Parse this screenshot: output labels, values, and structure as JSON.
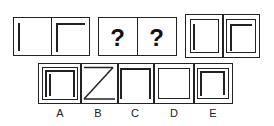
{
  "puzzle": {
    "given_panels": [
      {
        "id": "panel-1",
        "description": "single vertical line"
      },
      {
        "id": "panel-2",
        "description": "vertical line with top horizontal line"
      }
    ],
    "unknown_panels": [
      {
        "id": "unknown-1",
        "symbol": "?"
      },
      {
        "id": "unknown-2",
        "symbol": "?"
      }
    ],
    "result_panels": [
      {
        "id": "result-1",
        "description": "square frame inside frame with one vertical line"
      },
      {
        "id": "result-2",
        "description": "square frame inside frame with corner lines"
      }
    ]
  },
  "options": [
    {
      "label": "A"
    },
    {
      "label": "B"
    },
    {
      "label": "C"
    },
    {
      "label": "D"
    },
    {
      "label": "E"
    }
  ],
  "colors": {
    "stroke": "#222222",
    "background": "#ffffff"
  }
}
